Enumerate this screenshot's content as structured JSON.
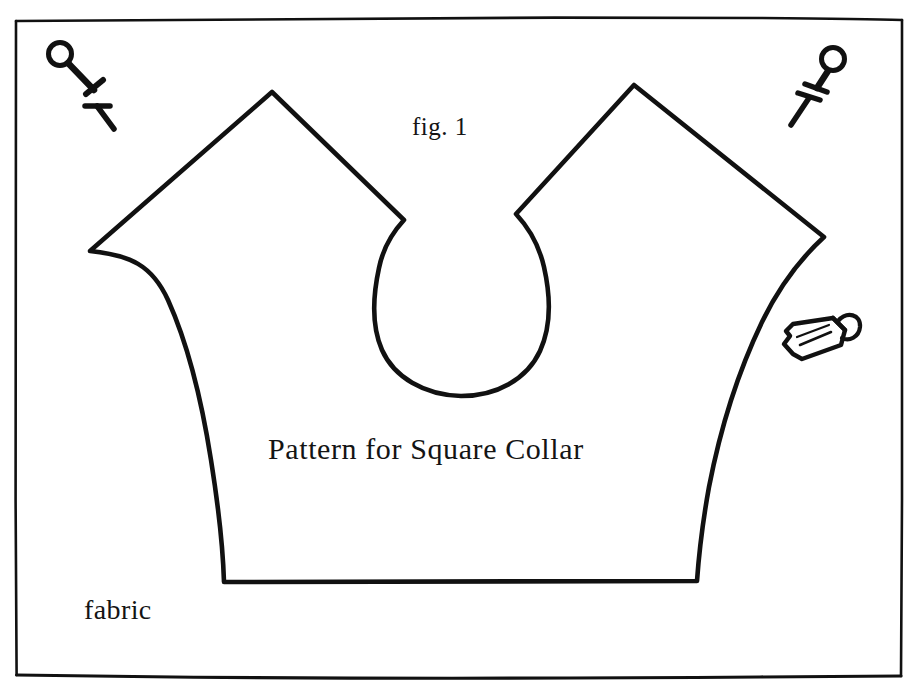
{
  "figure": {
    "title": "Pattern for Square Collar",
    "fig_number": "fig. 1",
    "fabric_label": "fabric",
    "ink_color": "#111111",
    "paper_color": "#ffffff"
  },
  "labels": {
    "fig": "fig. 1",
    "pattern": "Pattern for Square Collar",
    "fabric": "fabric"
  },
  "icons": {
    "pin_top_left": "push-pin-icon",
    "pin_top_right": "push-pin-icon",
    "pencil": "pencil-icon"
  },
  "drawing": {
    "frame": {
      "left": 15,
      "top": 19,
      "right": 903,
      "bottom": 676,
      "stroke": "#111111",
      "stroke_width": 2.5
    },
    "collar_outline_stroke": "#111111",
    "collar_outline_width": 4.5,
    "points": {
      "left_peak": [
        272,
        92
      ],
      "right_peak": [
        634,
        85
      ],
      "left_shoulder": [
        90,
        251
      ],
      "right_shoulder": [
        824,
        236
      ],
      "left_notch": [
        404,
        220
      ],
      "right_notch": [
        516,
        214
      ],
      "bottom_left": [
        224,
        582
      ],
      "bottom_right": [
        697,
        581
      ],
      "neck_bottom": [
        461,
        372
      ]
    }
  }
}
